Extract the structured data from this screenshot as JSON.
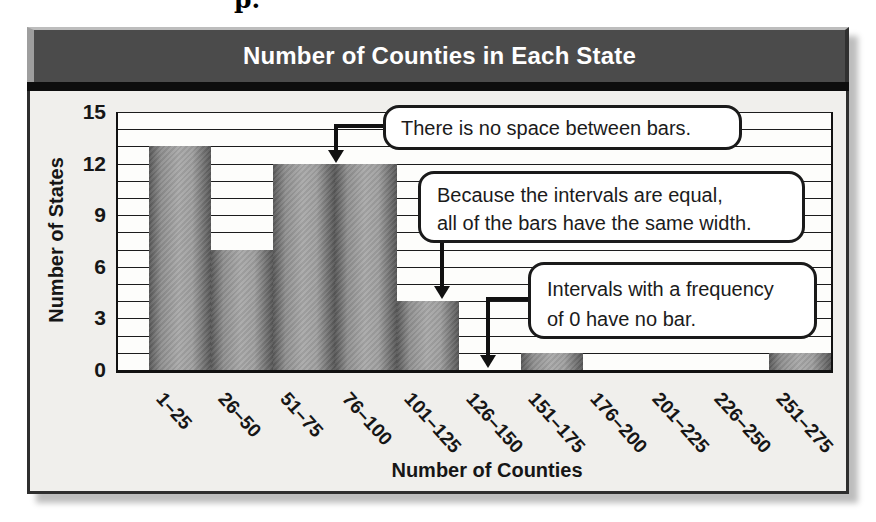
{
  "page": {
    "artifact_text": "p."
  },
  "header": {
    "title": "Number of Counties in Each State"
  },
  "y_axis": {
    "label": "Number of States"
  },
  "x_axis": {
    "label": "Number of Counties"
  },
  "callouts": {
    "no_space": {
      "text": "There is no space between bars."
    },
    "equal_width": {
      "line1": "Because the intervals are equal,",
      "line2": "all of the bars have the same width."
    },
    "zero_freq": {
      "line1": "Intervals with a frequency",
      "line2": "of 0 have no bar."
    }
  },
  "chart_data": {
    "type": "bar",
    "title": "Number of Counties in Each State",
    "xlabel": "Number of Counties",
    "ylabel": "Number of States",
    "categories": [
      "1–25",
      "26–50",
      "51–75",
      "76–100",
      "101–125",
      "126–150",
      "151–175",
      "176–200",
      "201–225",
      "226–250",
      "251–275"
    ],
    "values": [
      13,
      7,
      12,
      12,
      4,
      0,
      1,
      0,
      0,
      0,
      1
    ],
    "ylim": [
      0,
      15
    ],
    "yticks": [
      0,
      3,
      6,
      9,
      12,
      15
    ],
    "gridline_interval": 1,
    "bar_gap": 0,
    "grid": true,
    "legend": false,
    "annotations": [
      "There is no space between bars.",
      "Because the intervals are equal, all of the bars have the same width.",
      "Intervals with a frequency of 0 have no bar."
    ]
  },
  "colors": {
    "title_bar": "#4b4b4b",
    "title_text": "#ffffff",
    "panel_bg": "#f0efec",
    "plot_bg": "#fdfdfb",
    "grid": "#1c1c1c",
    "bar_dark": "#585858",
    "bar_light": "#a9a9a9",
    "callout_border": "#1a1a1a",
    "shadow": "#bdbdbd"
  }
}
